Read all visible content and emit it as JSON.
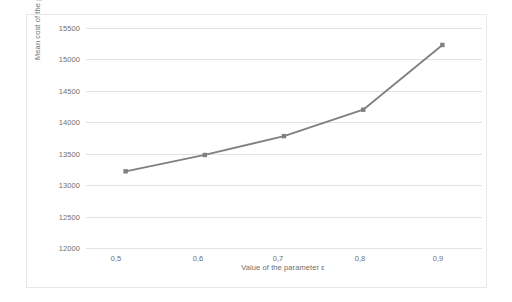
{
  "chart_data": {
    "type": "line",
    "title": "",
    "xlabel": "Value of the parameter ε",
    "ylabel": "Mean cost of the production",
    "x": [
      0.5,
      0.6,
      0.7,
      0.8,
      0.9
    ],
    "xtick_labels": [
      "0,5",
      "0,6",
      "0,7",
      "0,8",
      "0,9"
    ],
    "values": [
      13220,
      13480,
      13780,
      14200,
      15230
    ],
    "series": [
      {
        "name": "Mean cost of the production",
        "values": [
          13220,
          13480,
          13780,
          14200,
          15230
        ],
        "color": "#808080",
        "marker": "square"
      }
    ],
    "ylim": [
      12000,
      15500
    ],
    "ytick_labels": [
      "15500",
      "15000",
      "14500",
      "14000",
      "13500",
      "13000",
      "12500",
      "12000"
    ],
    "ytick_values": [
      15500,
      15000,
      14500,
      14000,
      13500,
      13000,
      12500,
      12000
    ],
    "grid": "horizontal",
    "legend": "none",
    "frame_border_color": "#e8e8e8",
    "gridline_color": "#e3e3e3",
    "text_color": "#6f6f6f"
  }
}
